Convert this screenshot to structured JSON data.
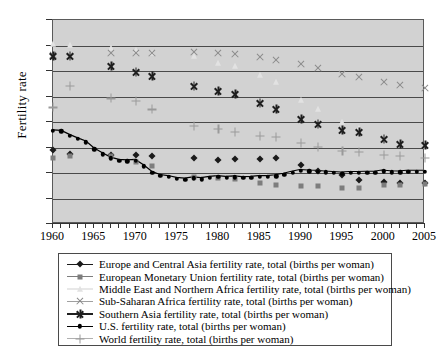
{
  "chart_data": {
    "type": "scatter",
    "title": "",
    "xlabel": "",
    "ylabel": "Fertility rate",
    "xlim": [
      1960,
      2005
    ],
    "ylim": [
      0,
      8
    ],
    "ytick_labels": [
      "0",
      "1",
      "2",
      "3",
      "4",
      "5",
      "6",
      "7",
      "8"
    ],
    "ytick_values": [
      0,
      1,
      2,
      3,
      4,
      5,
      6,
      7,
      8
    ],
    "xtick_labels": [
      "1960",
      "1965",
      "1970",
      "1975",
      "1980",
      "1985",
      "1990",
      "1995",
      "2000",
      "2005"
    ],
    "xtick_values": [
      1960,
      1965,
      1970,
      1975,
      1980,
      1985,
      1990,
      1995,
      2000,
      2005
    ],
    "grid": "horizontal",
    "legend_position": "bottom",
    "plot_background": "#d2d2d2",
    "series": [
      {
        "name": "Europe and Central Asia fertility rate, total (births per woman)",
        "marker": "diamond",
        "color": "#1a1a1a",
        "line": true,
        "x": [
          1960,
          1962,
          1967,
          1970,
          1972,
          1977,
          1980,
          1982,
          1985,
          1987,
          1990,
          1992,
          1995,
          1997,
          2000,
          2002,
          2005
        ],
        "y": [
          2.92,
          2.76,
          2.72,
          2.69,
          2.66,
          2.58,
          2.5,
          2.54,
          2.56,
          2.58,
          2.3,
          2.07,
          1.93,
          1.74,
          1.63,
          1.62,
          1.6
        ]
      },
      {
        "name": "European Monetary Union fertility rate, total (births per woman)",
        "marker": "square",
        "color": "#7d7d7d",
        "line": true,
        "x": [
          1960,
          1962,
          1967,
          1970,
          1972,
          1977,
          1980,
          1982,
          1985,
          1987,
          1990,
          1992,
          1995,
          1997,
          2000,
          2002,
          2005
        ],
        "y": [
          2.59,
          2.67,
          2.66,
          2.44,
          2.27,
          1.84,
          1.8,
          1.76,
          1.59,
          1.53,
          1.5,
          1.48,
          1.4,
          1.43,
          1.54,
          1.52,
          1.57
        ]
      },
      {
        "name": "Middle East and Northern Africa fertility rate, total (births per woman)",
        "marker": "triangle",
        "color": "#e2e2e2",
        "line": false,
        "x": [
          1960,
          1962,
          1967,
          1970,
          1972,
          1977,
          1980,
          1982,
          1985,
          1987,
          1990,
          1992,
          1995,
          1997,
          2000,
          2002,
          2005
        ],
        "y": [
          7.05,
          7.03,
          6.92,
          6.83,
          6.72,
          6.58,
          6.3,
          6.21,
          5.85,
          5.55,
          4.88,
          4.52,
          4.0,
          3.75,
          3.35,
          3.2,
          3.05
        ]
      },
      {
        "name": "Sub-Saharan Africa fertility rate, total (births per woman)",
        "marker": "x",
        "color": "#8a8a8a",
        "line": true,
        "x": [
          1960,
          1962,
          1967,
          1970,
          1972,
          1977,
          1980,
          1982,
          1985,
          1987,
          1990,
          1992,
          1995,
          1997,
          2000,
          2002,
          2005
        ],
        "y": [
          6.62,
          6.6,
          6.72,
          6.7,
          6.72,
          6.73,
          6.7,
          6.66,
          6.54,
          6.45,
          6.26,
          6.12,
          5.88,
          5.76,
          5.56,
          5.47,
          5.32
        ]
      },
      {
        "name": "Southern Asia fertility rate, total (births per woman)",
        "marker": "star",
        "color": "#1f1f1f",
        "line": true,
        "x": [
          1960,
          1962,
          1967,
          1970,
          1972,
          1977,
          1980,
          1982,
          1985,
          1987,
          1990,
          1992,
          1995,
          1997,
          2000,
          2002,
          2005
        ],
        "y": [
          6.6,
          6.58,
          6.18,
          5.97,
          5.8,
          5.42,
          5.22,
          5.1,
          4.74,
          4.5,
          4.12,
          3.92,
          3.7,
          3.6,
          3.34,
          3.14,
          3.08
        ]
      },
      {
        "name": "U.S. fertility rate, total (births per woman)",
        "marker": "dot",
        "color": "#000000",
        "line": true,
        "x": [
          1960,
          1961,
          1962,
          1963,
          1964,
          1965,
          1966,
          1967,
          1968,
          1969,
          1970,
          1971,
          1972,
          1973,
          1974,
          1975,
          1976,
          1977,
          1978,
          1979,
          1980,
          1981,
          1982,
          1983,
          1984,
          1985,
          1986,
          1987,
          1988,
          1989,
          1990,
          1991,
          1992,
          1993,
          1994,
          1995,
          1996,
          1997,
          1998,
          1999,
          2000,
          2001,
          2002,
          2003,
          2004,
          2005
        ],
        "y": [
          3.65,
          3.63,
          3.47,
          3.33,
          3.21,
          2.93,
          2.74,
          2.57,
          2.48,
          2.46,
          2.48,
          2.27,
          2.01,
          1.88,
          1.84,
          1.77,
          1.74,
          1.79,
          1.76,
          1.81,
          1.84,
          1.81,
          1.83,
          1.8,
          1.81,
          1.84,
          1.84,
          1.87,
          1.93,
          2.01,
          2.08,
          2.06,
          2.05,
          2.02,
          2.0,
          1.98,
          2.0,
          2.0,
          2.01,
          2.01,
          2.06,
          2.03,
          2.02,
          2.05,
          2.05,
          2.05
        ]
      },
      {
        "name": "World fertility rate, total (births per woman)",
        "marker": "plus",
        "color": "#9a9a9a",
        "line": true,
        "x": [
          1960,
          1962,
          1967,
          1970,
          1972,
          1977,
          1980,
          1982,
          1985,
          1987,
          1990,
          1992,
          1995,
          1997,
          2000,
          2002,
          2005
        ],
        "y": [
          4.57,
          5.42,
          4.93,
          4.82,
          4.5,
          3.85,
          3.74,
          3.6,
          3.46,
          3.42,
          3.17,
          3.02,
          2.86,
          2.82,
          2.7,
          2.66,
          2.6
        ]
      }
    ]
  },
  "legend": {
    "items": [
      {
        "label": "Europe and Central Asia fertility rate, total (births per woman)",
        "marker": "diamond",
        "color": "#1a1a1a",
        "line_color": "#1a1a1a"
      },
      {
        "label": "European Monetary Union fertility rate, total (births per woman)",
        "marker": "square",
        "color": "#7d7d7d",
        "line_color": "#7d7d7d"
      },
      {
        "label": "Middle East and Northern Africa fertility rate, total (births per woman)",
        "marker": "triangle",
        "color": "#e2e2e2",
        "line_color": "#e8e8e8"
      },
      {
        "label": "Sub-Saharan Africa fertility rate, total (births per woman)",
        "marker": "x",
        "color": "#8a8a8a",
        "line_color": "#a0a0a0"
      },
      {
        "label": "Southern Asia fertility rate, total (births per woman)",
        "marker": "star",
        "color": "#1f1f1f",
        "line_color": "#1f1f1f"
      },
      {
        "label": "U.S. fertility rate, total (births per woman)",
        "marker": "dot",
        "color": "#000000",
        "line_color": "#000000"
      },
      {
        "label": "World fertility rate, total (births per woman)",
        "marker": "plus",
        "color": "#9a9a9a",
        "line_color": "#b0b0b0"
      }
    ]
  }
}
